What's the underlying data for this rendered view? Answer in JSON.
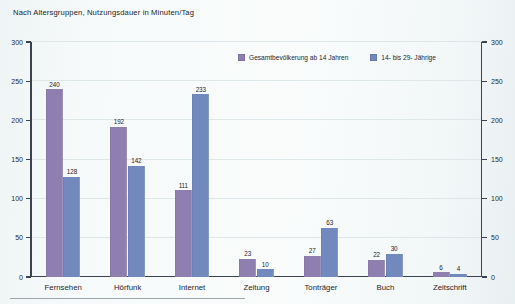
{
  "title": "Nach Altersgruppen, Nutzungsdauer in Minuten/Tag",
  "colors": {
    "series_a": "#8e7fb0",
    "series_b": "#7189bc",
    "axis": "#3b4350",
    "grid": "#dde6e8",
    "background": "#f7fafa",
    "text": "#20252c"
  },
  "legend": {
    "position": "top-right",
    "entries": [
      {
        "label": "Gesamtbevölkerung ab 14 Jahren",
        "color": "#8e7fb0",
        "swatch": "legend-swatch-purple"
      },
      {
        "label": "14- bis 29- Jährige",
        "color": "#7189bc",
        "swatch": "legend-swatch-blue"
      }
    ]
  },
  "chart_data": {
    "type": "bar",
    "title": "Nach Altersgruppen, Nutzungsdauer in Minuten/Tag",
    "xlabel": "",
    "ylabel": "",
    "ylim": [
      0,
      300
    ],
    "yticks": [
      0,
      50,
      100,
      150,
      200,
      250,
      300
    ],
    "ytick_labels_left": [
      "0",
      "50",
      "100",
      "150",
      "200",
      "250",
      "300"
    ],
    "ytick_labels_right": [
      "0",
      "50",
      "100",
      "150",
      "200",
      "250",
      "300"
    ],
    "grid": true,
    "dual_axis": true,
    "legend_position": "top-right",
    "categories": [
      "Fernsehen",
      "Hörfunk",
      "Internet",
      "Zeitung",
      "Tonträger",
      "Buch",
      "Zeitschrift"
    ],
    "series": [
      {
        "name": "Gesamtbevölkerung ab 14 Jahren",
        "color": "#8e7fb0",
        "values": [
          240,
          192,
          111,
          23,
          27,
          22,
          6
        ]
      },
      {
        "name": "14- bis 29- Jährige",
        "color": "#7189bc",
        "values": [
          128,
          142,
          233,
          10,
          63,
          30,
          4
        ]
      }
    ],
    "data_labels": [
      {
        "category": "Fernsehen",
        "a": "240",
        "b": "128"
      },
      {
        "category": "Hörfunk",
        "a": "192",
        "b": "142"
      },
      {
        "category": "Internet",
        "a": "111",
        "b": "233"
      },
      {
        "category": "Zeitung",
        "a": "23",
        "b": "10"
      },
      {
        "category": "Tonträger",
        "a": "27",
        "b": "63"
      },
      {
        "category": "Buch",
        "a": "22",
        "b": "30"
      },
      {
        "category": "Zeitschrift",
        "a": "6",
        "b": "4"
      }
    ]
  }
}
